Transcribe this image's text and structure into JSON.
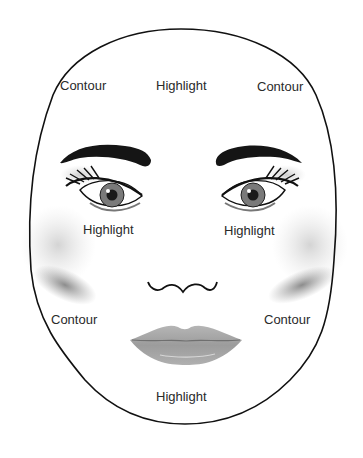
{
  "diagram": {
    "labels": {
      "forehead_left": "Contour",
      "forehead_center": "Highlight",
      "forehead_right": "Contour",
      "under_eye_left": "Highlight",
      "under_eye_right": "Highlight",
      "jaw_left": "Contour",
      "jaw_right": "Contour",
      "chin": "Highlight"
    },
    "colors": {
      "outline": "#111111",
      "brow": "#151515",
      "contour_shade": "#8a8a8a",
      "highlight_shade": "#e4e4e4",
      "lips": "#a9a9a9",
      "iris": "#7a7a7a",
      "text": "#2a2a2a"
    }
  }
}
